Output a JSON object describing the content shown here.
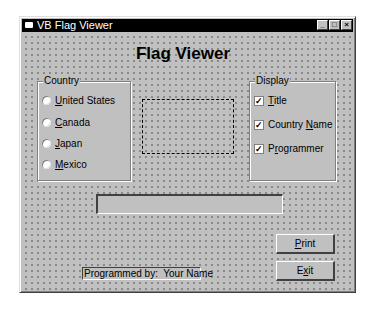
{
  "window": {
    "title": "VB Flag Viewer",
    "controls": {
      "minimize": "_",
      "maximize": "□",
      "close": "×"
    }
  },
  "form": {
    "heading": "Flag Viewer",
    "country_frame": {
      "caption": "Country",
      "options": [
        {
          "label_pre": "",
          "accel": "U",
          "label_post": "nited States",
          "selected": false
        },
        {
          "label_pre": "",
          "accel": "C",
          "label_post": "anada",
          "selected": false
        },
        {
          "label_pre": "",
          "accel": "J",
          "label_post": "apan",
          "selected": false
        },
        {
          "label_pre": "",
          "accel": "M",
          "label_post": "exico",
          "selected": false
        }
      ]
    },
    "display_frame": {
      "caption": "Display",
      "checkboxes": [
        {
          "label_pre": "",
          "accel": "T",
          "label_post": "itle",
          "checked": true,
          "mark": "✓"
        },
        {
          "label_pre": "Country ",
          "accel": "N",
          "label_post": "ame",
          "checked": true,
          "mark": "✓"
        },
        {
          "label_pre": "P",
          "accel": "r",
          "label_post": "ogrammer",
          "checked": true,
          "mark": "✓"
        }
      ]
    },
    "flag_image": {
      "placeholder": ""
    },
    "country_text": {
      "value": ""
    },
    "buttons": {
      "print": {
        "label_pre": "",
        "accel": "P",
        "label_post": "rint"
      },
      "exit": {
        "label_pre": "E",
        "accel": "x",
        "label_post": "it"
      }
    },
    "programmer_label": "Programmed by:  Your Name"
  }
}
